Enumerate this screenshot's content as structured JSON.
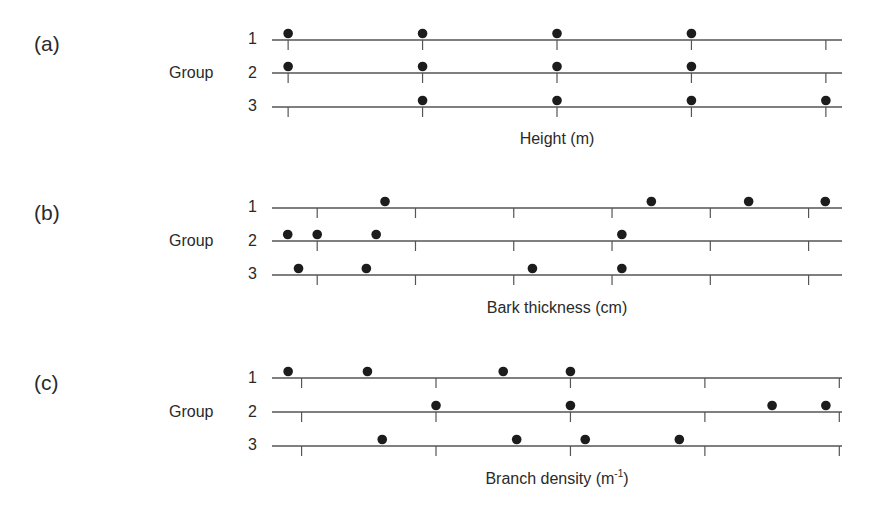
{
  "chart_data": [
    {
      "type": "scatter",
      "panel": "(a)",
      "group_axis_label": "Group",
      "groups": [
        "1",
        "2",
        "3"
      ],
      "xlabel": "Height (m)",
      "x_units": "tick index (axis has no numeric tick labels)",
      "ticks": [
        0,
        1,
        2,
        3,
        4
      ],
      "tick_labels": [],
      "xlim": [
        -0.12,
        4.12
      ],
      "series": [
        {
          "name": "1",
          "values": [
            0,
            1,
            2,
            3
          ]
        },
        {
          "name": "2",
          "values": [
            0,
            1,
            2,
            3
          ]
        },
        {
          "name": "3",
          "values": [
            1,
            2,
            3,
            4
          ]
        }
      ],
      "grid": false
    },
    {
      "type": "scatter",
      "panel": "(b)",
      "group_axis_label": "Group",
      "groups": [
        "1",
        "2",
        "3"
      ],
      "xlabel": "Bark thickness (cm)",
      "x_units": "tick index (axis has no numeric tick labels)",
      "ticks": [
        0,
        1,
        2,
        3,
        4,
        5
      ],
      "tick_labels": [],
      "xlim": [
        -0.46,
        5.34
      ],
      "series": [
        {
          "name": "1",
          "values": [
            0.69,
            3.4,
            4.39,
            5.17
          ]
        },
        {
          "name": "2",
          "values": [
            -0.3,
            0.0,
            0.6,
            3.1
          ]
        },
        {
          "name": "3",
          "values": [
            -0.19,
            0.5,
            2.19,
            3.1
          ]
        }
      ],
      "grid": false
    },
    {
      "type": "scatter",
      "panel": "(c)",
      "group_axis_label": "Group",
      "groups": [
        "1",
        "2",
        "3"
      ],
      "xlabel": "Branch density (m",
      "xlabel_superscript": "-1",
      "xlabel_suffix": ")",
      "x_units": "tick index (axis has no numeric tick labels)",
      "ticks": [
        0,
        1,
        2,
        3,
        4
      ],
      "tick_labels": [],
      "xlim": [
        -0.22,
        4.02
      ],
      "series": [
        {
          "name": "1",
          "values": [
            -0.1,
            0.49,
            1.5,
            2.0
          ]
        },
        {
          "name": "2",
          "values": [
            1.0,
            2.0,
            3.5,
            3.9
          ]
        },
        {
          "name": "3",
          "values": [
            0.6,
            1.6,
            2.11,
            2.81
          ]
        }
      ],
      "grid": false
    }
  ]
}
